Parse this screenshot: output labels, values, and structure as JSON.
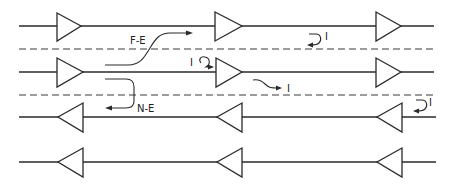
{
  "diagram": {
    "type": "signal-line-crosstalk",
    "width": 454,
    "height": 188,
    "colors": {
      "stroke": "#2a2a2a",
      "background": "#ffffff"
    },
    "lines": [
      {
        "id": "line-1",
        "y": 26,
        "direction": "right",
        "x_start": 19,
        "x_end": 434,
        "amplifiers_x": [
          57,
          215,
          376
        ]
      },
      {
        "id": "line-2",
        "y": 72,
        "direction": "right",
        "x_start": 19,
        "x_end": 434,
        "amplifiers_x": [
          57,
          216,
          376
        ]
      },
      {
        "id": "line-3",
        "y": 117,
        "direction": "left",
        "x_start": 19,
        "x_end": 436,
        "amplifiers_x": [
          58,
          217,
          377
        ]
      },
      {
        "id": "line-4",
        "y": 162,
        "direction": "left",
        "x_start": 19,
        "x_end": 436,
        "amplifiers_x": [
          58,
          217,
          377
        ]
      }
    ],
    "separators": [
      {
        "id": "separator-1",
        "y": 49
      },
      {
        "id": "separator-2",
        "y": 95
      }
    ],
    "labels": {
      "far_end": "F-E",
      "near_end": "N-E",
      "interference_1": "I",
      "interference_2": "I",
      "interference_3": "I",
      "interference_4": "I"
    }
  }
}
